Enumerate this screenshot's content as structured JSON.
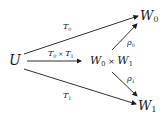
{
  "nodes": {
    "U": {
      "base": "U",
      "sub": ""
    },
    "W0": {
      "base": "W",
      "sub": "0"
    },
    "W1": {
      "base": "W",
      "sub": "1"
    },
    "product": {
      "a_base": "W",
      "a_sub": "0",
      "op": " × ",
      "b_base": "W",
      "b_sub": "1"
    }
  },
  "edges": {
    "U_to_W0": {
      "base": "T",
      "sub": "0"
    },
    "U_to_product": {
      "a_base": "T",
      "a_sub": "0",
      "op": " × ",
      "b_base": "T",
      "b_sub": "1"
    },
    "U_to_W1": {
      "base": "T",
      "sub": "1"
    },
    "product_to_W0": {
      "base": "ρ",
      "sub": "0"
    },
    "product_to_W1": {
      "base": "ρ",
      "sub": "1"
    }
  }
}
